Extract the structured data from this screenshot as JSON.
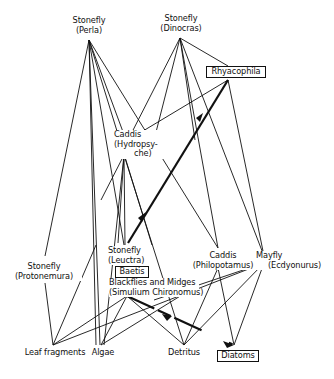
{
  "diagram": {
    "type": "food-web",
    "nodes": {
      "perla": {
        "line1": "Stonefly",
        "line2": "(Perla)",
        "x": 89,
        "y": 40
      },
      "dinocras": {
        "line1": "Stonefly",
        "line2": "(Dinocras)",
        "x": 180,
        "y": 38
      },
      "rhyacophila": {
        "line1": "Rhyacophila",
        "boxed": true,
        "x": 228,
        "y": 80
      },
      "hydropsyche": {
        "line1": "Caddis",
        "line2": "(Hydropsy-",
        "line3": "che)",
        "x": 126,
        "y": 140
      },
      "protonemura": {
        "line1": "Stonefly",
        "line2": "(Protonemura)",
        "x": 46,
        "y": 256
      },
      "leuctra": {
        "line1": "Stonefly",
        "line2": "(Leuctra)",
        "x": 126,
        "y": 245
      },
      "boetis": {
        "line1": "Baetis",
        "boxed": true
      },
      "blackflies": {
        "line1": "Blackflies and Midges",
        "line2": "(Simulium Chironomus)",
        "x": 127,
        "y": 295
      },
      "philopotamus": {
        "line1": "Caddis",
        "line2": "(Philopotamus)",
        "x": 218,
        "y": 248
      },
      "ecdyonurus": {
        "line1": "Mayfly",
        "line2": "(Ecdyonurus)",
        "x": 266,
        "y": 256
      },
      "leaf": {
        "line1": "Leaf fragments",
        "x": 53,
        "y": 345
      },
      "algae": {
        "line1": "Algae",
        "x": 101,
        "y": 345
      },
      "detritus": {
        "line1": "Detritus",
        "x": 184,
        "y": 345
      },
      "diatoms": {
        "line1": "Diatoms",
        "boxed": true,
        "x": 234,
        "y": 345
      }
    },
    "edges": [
      {
        "from": "perla",
        "to": "protonemura",
        "strong": false
      },
      {
        "from": "perla",
        "to": "leuctra",
        "strong": false
      },
      {
        "from": "perla",
        "to": "hydropsyche",
        "strong": false
      },
      {
        "from": "perla",
        "to": "algae",
        "strong": false
      },
      {
        "from": "perla",
        "to": "philopotamus",
        "strong": false
      },
      {
        "from": "perla",
        "to": "blackflies",
        "strong": false
      },
      {
        "from": "dinocras",
        "to": "rhyacophila",
        "strong": false
      },
      {
        "from": "dinocras",
        "to": "hydropsyche",
        "strong": false
      },
      {
        "from": "dinocras",
        "to": "leuctra",
        "strong": false
      },
      {
        "from": "dinocras",
        "to": "philopotamus",
        "strong": false
      },
      {
        "from": "dinocras",
        "to": "ecdyonurus",
        "strong": false
      },
      {
        "from": "rhyacophila",
        "to": "hydropsyche",
        "strong": false
      },
      {
        "from": "rhyacophila",
        "to": "leuctra",
        "strong": true
      },
      {
        "from": "rhyacophila",
        "to": "ecdyonurus",
        "strong": false
      },
      {
        "from": "hydropsyche",
        "to": "leuctra",
        "strong": false
      },
      {
        "from": "hydropsyche",
        "to": "algae",
        "strong": false
      },
      {
        "from": "hydropsyche",
        "to": "protonemura",
        "strong": false
      },
      {
        "from": "hydropsyche",
        "to": "detritus",
        "strong": false
      },
      {
        "from": "protonemura",
        "to": "leaf",
        "strong": false
      },
      {
        "from": "leuctra",
        "to": "leaf",
        "strong": false
      },
      {
        "from": "blackflies",
        "to": "leaf",
        "strong": false
      },
      {
        "from": "blackflies",
        "to": "algae",
        "strong": false
      },
      {
        "from": "blackflies",
        "to": "detritus",
        "strong": false
      },
      {
        "from": "blackflies",
        "to": "diatoms",
        "strong": true
      },
      {
        "from": "philopotamus",
        "to": "detritus",
        "strong": false
      },
      {
        "from": "philopotamus",
        "to": "diatoms",
        "strong": false
      },
      {
        "from": "philopotamus",
        "to": "algae",
        "strong": false
      },
      {
        "from": "ecdyonurus",
        "to": "leaf",
        "strong": false
      },
      {
        "from": "ecdyonurus",
        "to": "detritus",
        "strong": false
      },
      {
        "from": "ecdyonurus",
        "to": "diatoms",
        "strong": false
      }
    ]
  }
}
